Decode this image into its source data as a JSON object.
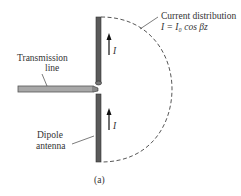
{
  "figure": {
    "current_distribution_label": "Current distribution",
    "current_equation": "I = I₀ cos βz",
    "transmission_line_label_line1": "Transmission",
    "transmission_line_label_line2": "line",
    "dipole_label_line1": "Dipole",
    "dipole_label_line2": "antenna",
    "current_symbol_upper": "I",
    "current_symbol_lower": "I",
    "caption": "(a)"
  },
  "colors": {
    "antenna": "#555555",
    "transmission_line": "#9a9a9a",
    "dashed_curve": "#444444"
  }
}
